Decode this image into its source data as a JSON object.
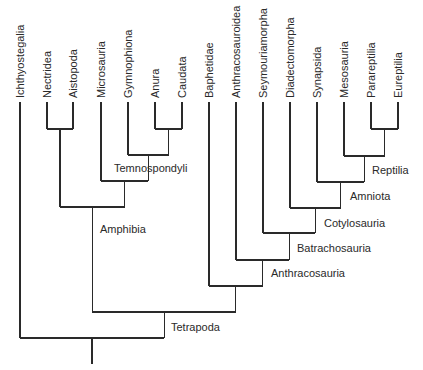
{
  "diagram": {
    "type": "cladogram",
    "tip_top_y": 102,
    "text_bottom_y": 98,
    "root_stem_bottom_y": 364,
    "stroke_color": "#2a2a2a",
    "taxa": [
      {
        "id": "ichthyostegalia",
        "label": "Ichthyostegalia",
        "x": 20
      },
      {
        "id": "nectridea",
        "label": "Nectridea",
        "x": 47
      },
      {
        "id": "aistopoda",
        "label": "Aistopoda",
        "x": 73
      },
      {
        "id": "microsauria",
        "label": "Microsauria",
        "x": 101
      },
      {
        "id": "gymnophiona",
        "label": "Gymnophiona",
        "x": 128
      },
      {
        "id": "anura",
        "label": "Anura",
        "x": 155
      },
      {
        "id": "caudata",
        "label": "Caudata",
        "x": 182
      },
      {
        "id": "baphetidae",
        "label": "Baphetidae",
        "x": 209
      },
      {
        "id": "anthracosauroidea",
        "label": "Anthracosauroidea",
        "x": 236
      },
      {
        "id": "seymouriamorpha",
        "label": "Seymouriamorpha",
        "x": 263
      },
      {
        "id": "diadectomorpha",
        "label": "Diadectomorpha",
        "x": 290
      },
      {
        "id": "synapsida",
        "label": "Synapsida",
        "x": 317
      },
      {
        "id": "mesosauria",
        "label": "Mesosauria",
        "x": 344
      },
      {
        "id": "parareptilia",
        "label": "Parareptilia",
        "x": 371
      },
      {
        "id": "eureptilia",
        "label": "Eureptilia",
        "x": 398
      }
    ],
    "nodes": [
      {
        "id": "n_nect_aist",
        "children": [
          "nectridea",
          "aistopoda"
        ],
        "y": 129,
        "label": ""
      },
      {
        "id": "n_anura_caud",
        "children": [
          "anura",
          "caudata"
        ],
        "y": 129,
        "label": ""
      },
      {
        "id": "n_temno",
        "children": [
          "gymnophiona",
          "n_anura_caud"
        ],
        "y": 155,
        "label": "Temnospondyli",
        "label_x": 114,
        "label_y": 172
      },
      {
        "id": "n_micro",
        "children": [
          "microsauria",
          "n_temno"
        ],
        "y": 181,
        "label": ""
      },
      {
        "id": "n_amphibia",
        "children": [
          "n_nect_aist",
          "n_micro"
        ],
        "y": 207,
        "label": "Amphibia",
        "label_x": 100,
        "label_y": 233
      },
      {
        "id": "n_para_eu",
        "children": [
          "parareptilia",
          "eureptilia"
        ],
        "y": 129,
        "label": ""
      },
      {
        "id": "n_reptilia",
        "children": [
          "mesosauria",
          "n_para_eu"
        ],
        "y": 156,
        "label": "Reptilia",
        "label_x": 372,
        "label_y": 174
      },
      {
        "id": "n_amniota",
        "children": [
          "synapsida",
          "n_reptilia"
        ],
        "y": 182,
        "label": "Amniota",
        "label_x": 350,
        "label_y": 200
      },
      {
        "id": "n_cotylo",
        "children": [
          "diadectomorpha",
          "n_amniota"
        ],
        "y": 208,
        "label": "Cotylosauria",
        "label_x": 324,
        "label_y": 227
      },
      {
        "id": "n_batracho",
        "children": [
          "seymouriamorpha",
          "n_cotylo"
        ],
        "y": 233,
        "label": "Batrachosauria",
        "label_x": 297,
        "label_y": 252
      },
      {
        "id": "n_anthraco",
        "children": [
          "anthracosauroidea",
          "n_batracho"
        ],
        "y": 260,
        "label": "Anthracosauria",
        "label_x": 271,
        "label_y": 277
      },
      {
        "id": "n_anthraco_full",
        "children": [
          "baphetidae",
          "n_anthraco"
        ],
        "y": 286,
        "label": ""
      },
      {
        "id": "n_tetrapoda",
        "children": [
          "n_amphibia",
          "n_anthraco_full"
        ],
        "y": 312,
        "label": "Tetrapoda",
        "label_x": 171,
        "label_y": 331
      },
      {
        "id": "n_root",
        "children": [
          "ichthyostegalia",
          "n_tetrapoda"
        ],
        "y": 338,
        "label": ""
      }
    ]
  }
}
